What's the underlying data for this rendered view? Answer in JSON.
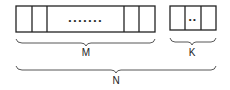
{
  "diagram": {
    "group_m": {
      "label": "M",
      "cells": 5,
      "ellipsis": "•••••••"
    },
    "group_k": {
      "label": "K",
      "cells": 3,
      "ellipsis": "••"
    },
    "total": {
      "label": "N"
    }
  }
}
